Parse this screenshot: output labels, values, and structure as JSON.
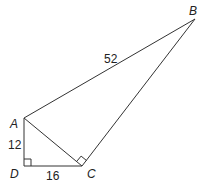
{
  "figure": {
    "vertices": {
      "A": {
        "label": "A",
        "x": 24,
        "y": 118
      },
      "B": {
        "label": "B",
        "x": 195,
        "y": 19
      },
      "C": {
        "label": "C",
        "x": 82,
        "y": 166
      },
      "D": {
        "label": "D",
        "x": 24,
        "y": 166
      }
    },
    "segments": [
      {
        "from": "A",
        "to": "B",
        "length_label": "52"
      },
      {
        "from": "A",
        "to": "D",
        "length_label": "12"
      },
      {
        "from": "D",
        "to": "C",
        "length_label": "16"
      },
      {
        "from": "A",
        "to": "C",
        "length_label": ""
      },
      {
        "from": "C",
        "to": "B",
        "length_label": ""
      }
    ],
    "right_angles": [
      "D",
      "C"
    ],
    "stroke_color": "#333333"
  }
}
